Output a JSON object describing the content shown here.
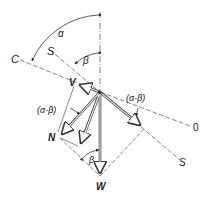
{
  "diagram": {
    "type": "force-vector-diagram",
    "labels": {
      "C": "C",
      "S_upper": "S",
      "S_lower": "S",
      "O": "0",
      "V": "V",
      "N": "N",
      "W": "W",
      "alpha": "α",
      "beta_upper": "β",
      "beta_lower": "β",
      "alpha_minus_beta_right": "(α-β)",
      "alpha_minus_beta_left": "(α-β)"
    },
    "origin": [
      100,
      92
    ],
    "lines": [
      {
        "name": "vertical-axis",
        "from": [
          100,
          12
        ],
        "to": [
          100,
          172
        ],
        "style": "dash-dot"
      },
      {
        "name": "C-line",
        "from": [
          20,
          60
        ],
        "to": [
          100,
          92
        ],
        "style": "dashed"
      },
      {
        "name": "S-line",
        "from": [
          50,
          50
        ],
        "to": [
          180,
          160
        ],
        "style": "dashed"
      },
      {
        "name": "O-line",
        "from": [
          100,
          92
        ],
        "to": [
          190,
          126
        ],
        "style": "dashed"
      }
    ],
    "vectors": [
      {
        "name": "V",
        "from": [
          100,
          92
        ],
        "to": [
          78,
          84
        ]
      },
      {
        "name": "N",
        "from": [
          100,
          92
        ],
        "to": [
          60,
          136
        ]
      },
      {
        "name": "middle",
        "from": [
          100,
          92
        ],
        "to": [
          80,
          146
        ]
      },
      {
        "name": "W",
        "from": [
          100,
          92
        ],
        "to": [
          100,
          176
        ]
      },
      {
        "name": "S-component",
        "from": [
          100,
          92
        ],
        "to": [
          142,
          127
        ]
      }
    ],
    "colors": {
      "stroke": "#333333",
      "dashed": "#555555",
      "background": "#ffffff"
    }
  }
}
